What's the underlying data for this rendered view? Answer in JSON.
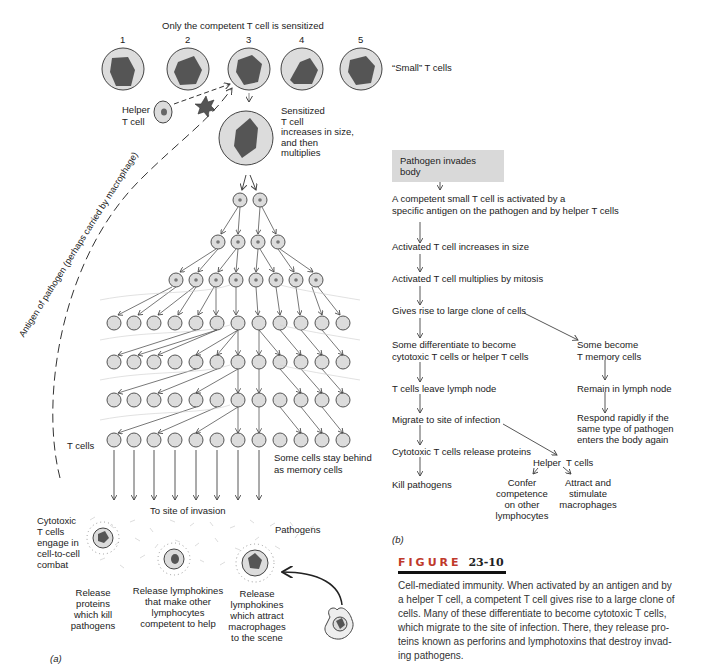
{
  "panel_a": {
    "top_label": "Only the competent T cell is sensitized",
    "cell_numbers": [
      "1",
      "2",
      "3",
      "4",
      "5"
    ],
    "small_t_cells_label": "“Small” T cells",
    "helper_label_1": "Helper",
    "helper_label_2": "T cell",
    "sensitized_lines": [
      "Sensitized",
      "T cell",
      "increases in size,",
      "and then",
      "multiplies"
    ],
    "antigen_path_label": "Antigen of pathogen (perhaps carried by macrophage)",
    "t_cells_label": "T cells",
    "memory_lines": [
      "Some cells stay behind",
      "as memory cells"
    ],
    "site_label": "To site of invasion",
    "pathogens_label": "Pathogens",
    "cytotoxic_lines": [
      "Cytotoxic",
      "T cells",
      "engage in",
      "cell-to-cell",
      "combat"
    ],
    "release_proteins_lines": [
      "Release",
      "proteins",
      "which kill",
      "pathogens"
    ],
    "release_lymphokines_help_lines": [
      "Release lymphokines",
      "that make other",
      "lymphocytes",
      "competent to help"
    ],
    "release_lymphokines_attract_lines": [
      "Release",
      "lymphokines",
      "which attract",
      "macrophages",
      "to the scene"
    ],
    "panel_label": "(a)"
  },
  "panel_b": {
    "box_label": "Pathogen invades body",
    "steps": [
      [
        "A competent small T cell is activated by a",
        "specific antigen on the pathogen and by helper T cells"
      ],
      [
        "Activated T cell increases in size"
      ],
      [
        "Activated T cell multiplies by mitosis"
      ],
      [
        "Gives rise to large clone of cells"
      ],
      [
        "Some differentiate to become",
        "cytotoxic T cells or helper T cells"
      ],
      [
        "T cells leave lymph node"
      ],
      [
        "Migrate to site of infection"
      ],
      [
        "Cytotoxic T cells release proteins"
      ],
      [
        "Kill pathogens"
      ]
    ],
    "memory_branch": [
      [
        "Some become",
        "T memory cells"
      ],
      [
        "Remain in lymph node"
      ],
      [
        "Respond rapidly if the",
        "same type of pathogen",
        "enters the body again"
      ]
    ],
    "helper_label": "Helper  T cells",
    "confer_lines": [
      "Confer",
      "competence",
      "on other",
      "lymphocytes"
    ],
    "attract_lines": [
      "Attract and",
      "stimulate",
      "macrophages"
    ],
    "panel_label": "(b)"
  },
  "figure": {
    "title_word": "FIGURE",
    "title_number": "23-10",
    "caption_lines": [
      "Cell-mediated immunity. When activated by an antigen and by",
      "a helper T cell, a competent T cell gives rise to a large clone of",
      "cells. Many of these differentiate to become cytotoxic T cells,",
      "which migrate to the site of infection. There, they release pro-",
      "teins known as perforins and lymphotoxins that destroy invad-",
      "ing pathogens."
    ]
  },
  "colors": {
    "cell_fill": "#dcdcdc",
    "cell_stroke": "#555555",
    "nucleus": "#555555",
    "box_fill": "#d9d9d9",
    "title_red": "#c0392b"
  }
}
